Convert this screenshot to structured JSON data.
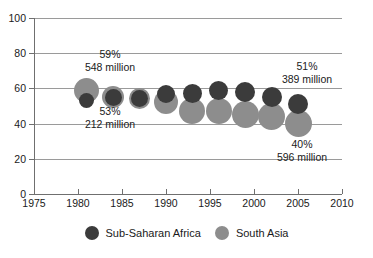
{
  "chart_data": {
    "type": "scatter",
    "title": "",
    "subtitle": "",
    "xlabel": "",
    "ylabel": "",
    "xlim": [
      1975,
      2010
    ],
    "ylim": [
      0,
      100
    ],
    "xticks": [
      1975,
      1980,
      1985,
      1990,
      1995,
      2000,
      2005,
      2010
    ],
    "yticks": [
      0,
      20,
      40,
      60,
      80,
      100
    ],
    "grid": true,
    "legend_position": "bottom",
    "note": "Bubble chart: bubble area is proportional to number of people in poverty (millions); y value is the poverty headcount percentage.",
    "series": [
      {
        "name": "Sub-Saharan Africa",
        "color": "#3b3b3b",
        "points": [
          {
            "x": 1981,
            "y": 53,
            "millions": 212,
            "r": 7.5
          },
          {
            "x": 1984,
            "y": 55,
            "millions": 242,
            "r": 8.5
          },
          {
            "x": 1987,
            "y": 54,
            "millions": 257,
            "r": 8.5
          },
          {
            "x": 1990,
            "y": 57,
            "millions": 296,
            "r": 9.0
          },
          {
            "x": 1993,
            "y": 57,
            "millions": 318,
            "r": 9.5
          },
          {
            "x": 1996,
            "y": 59,
            "millions": 344,
            "r": 9.5
          },
          {
            "x": 1999,
            "y": 58,
            "millions": 373,
            "r": 10.0
          },
          {
            "x": 2002,
            "y": 55,
            "millions": 385,
            "r": 10.0
          },
          {
            "x": 2005,
            "y": 51,
            "millions": 389,
            "r": 10.0
          }
        ]
      },
      {
        "name": "South Asia",
        "color": "#8d8d8d",
        "points": [
          {
            "x": 1981,
            "y": 59,
            "millions": 548,
            "r": 12.5
          },
          {
            "x": 1984,
            "y": 55,
            "millions": 548,
            "r": 11.0
          },
          {
            "x": 1987,
            "y": 54,
            "millions": 525,
            "r": 10.5
          },
          {
            "x": 1990,
            "y": 52,
            "millions": 549,
            "r": 12.0
          },
          {
            "x": 1993,
            "y": 47,
            "millions": 568,
            "r": 13.0
          },
          {
            "x": 1996,
            "y": 47,
            "millions": 572,
            "r": 13.0
          },
          {
            "x": 1999,
            "y": 45,
            "millions": 588,
            "r": 13.5
          },
          {
            "x": 2002,
            "y": 44,
            "millions": 593,
            "r": 13.5
          },
          {
            "x": 2005,
            "y": 40,
            "millions": 596,
            "r": 13.5
          }
        ]
      }
    ],
    "annotations": [
      {
        "id": "south-asia-1981",
        "percent": "59%",
        "value": "548 million"
      },
      {
        "id": "sub-saharan-1981",
        "percent": "53%",
        "value": "212 million"
      },
      {
        "id": "sub-saharan-2005",
        "percent": "51%",
        "value": "389 million"
      },
      {
        "id": "south-asia-2005",
        "percent": "40%",
        "value": "596 million"
      }
    ],
    "legend": [
      {
        "label": "Sub-Saharan Africa",
        "color": "#3b3b3b"
      },
      {
        "label": "South Asia",
        "color": "#8d8d8d"
      }
    ]
  }
}
